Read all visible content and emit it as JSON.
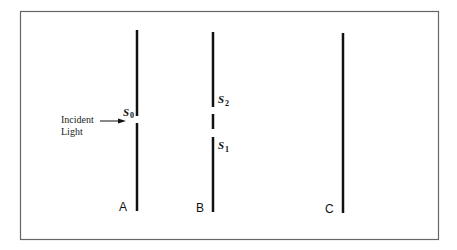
{
  "diagram": {
    "type": "double-slit experiment",
    "incident_label_line1": "Incident",
    "incident_label_line2": "Light",
    "screens": [
      {
        "label": "A",
        "slits": [
          {
            "name": "S",
            "sub": "0"
          }
        ]
      },
      {
        "label": "B",
        "slits": [
          {
            "name": "S",
            "sub": "2"
          },
          {
            "name": "S",
            "sub": "1"
          }
        ]
      },
      {
        "label": "C",
        "slits": []
      }
    ],
    "colors": {
      "line": "#111111",
      "frame": "#666666",
      "background": "#ffffff"
    }
  }
}
